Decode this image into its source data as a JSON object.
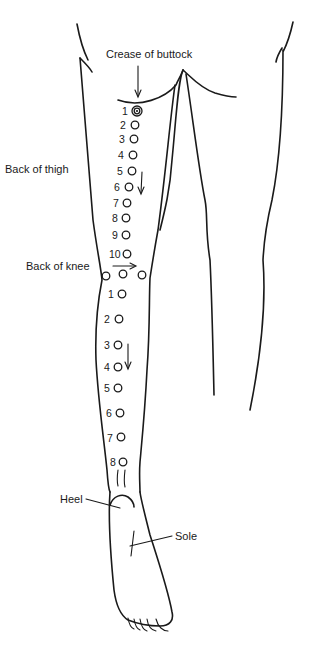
{
  "labels": {
    "crease_of_buttock": "Crease of buttock",
    "back_of_thigh": "Back of thigh",
    "back_of_knee": "Back of knee",
    "heel": "Heel",
    "sole": "Sole"
  },
  "thigh_points": [
    {
      "n": "1",
      "x": 137,
      "y": 111,
      "target": true
    },
    {
      "n": "2",
      "x": 135,
      "y": 125
    },
    {
      "n": "3",
      "x": 134,
      "y": 139
    },
    {
      "n": "4",
      "x": 133,
      "y": 155
    },
    {
      "n": "5",
      "x": 132,
      "y": 171
    },
    {
      "n": "6",
      "x": 129,
      "y": 187
    },
    {
      "n": "7",
      "x": 127,
      "y": 203
    },
    {
      "n": "8",
      "x": 126,
      "y": 218
    },
    {
      "n": "9",
      "x": 126,
      "y": 235
    },
    {
      "n": "10",
      "x": 124,
      "y": 254
    }
  ],
  "knee_points": [
    {
      "x": 106,
      "y": 276
    },
    {
      "x": 123,
      "y": 274
    },
    {
      "x": 142,
      "y": 275
    }
  ],
  "calf_points": [
    {
      "n": "1",
      "x": 120,
      "y": 295
    },
    {
      "n": "2",
      "x": 119,
      "y": 319
    },
    {
      "n": "3",
      "x": 117,
      "y": 345
    },
    {
      "n": "4",
      "x": 117,
      "y": 367
    },
    {
      "n": "5",
      "x": 118,
      "y": 388
    },
    {
      "n": "6",
      "x": 120,
      "y": 413
    },
    {
      "n": "7",
      "x": 121,
      "y": 437
    },
    {
      "n": "8",
      "x": 122,
      "y": 462
    }
  ],
  "colors": {
    "ink": "#1a1a1a",
    "background": "#ffffff"
  }
}
